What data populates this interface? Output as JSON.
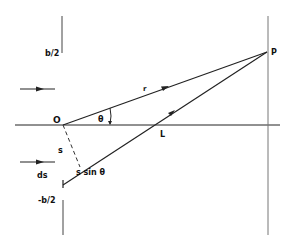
{
  "diagram": {
    "type": "single-slit diffraction geometry",
    "colors": {
      "line": "#222222",
      "screen": "#777777",
      "background": "#ffffff"
    },
    "labels": {
      "top_edge": "b/2",
      "bottom_edge": "-b/2",
      "origin": "O",
      "point": "P",
      "radius": "r",
      "angle": "θ",
      "lens_point": "L",
      "offset": "s",
      "element": "ds",
      "path_difference": "s sin θ"
    },
    "elements": [
      {
        "name": "slit-top-barrier",
        "kind": "line"
      },
      {
        "name": "slit-bottom-barrier",
        "kind": "line"
      },
      {
        "name": "screen-line",
        "kind": "line"
      },
      {
        "name": "optical-axis",
        "kind": "line"
      },
      {
        "name": "incident-arrow-upper",
        "kind": "arrow"
      },
      {
        "name": "incident-arrow-lower",
        "kind": "arrow"
      },
      {
        "name": "ray-O-to-P",
        "kind": "arrow"
      },
      {
        "name": "ray-ds-to-P",
        "kind": "arrow"
      },
      {
        "name": "perpendicular-dashed",
        "kind": "dashed-line"
      },
      {
        "name": "angle-arc-theta",
        "kind": "arc"
      }
    ]
  }
}
